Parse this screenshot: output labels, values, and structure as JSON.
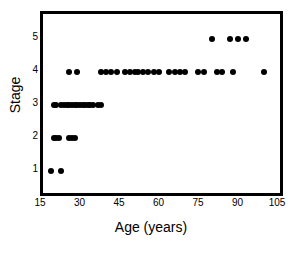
{
  "chart_data": {
    "type": "scatter",
    "title": "",
    "xlabel": "Age (years)",
    "ylabel": "Stage",
    "xlim": [
      15,
      105
    ],
    "ylim": [
      0.35,
      5.75
    ],
    "grid": false,
    "legend": "none",
    "marker": "filled-circle",
    "marker_color": "#000000",
    "xticks": [
      15,
      30,
      45,
      60,
      75,
      90,
      105
    ],
    "xtick_labels": [
      "15",
      "30",
      "45",
      "60",
      "75",
      "90",
      "105"
    ],
    "yticks": [
      1,
      2,
      3,
      4,
      5
    ],
    "ytick_labels": [
      "1",
      "2",
      "3",
      "4",
      "5"
    ],
    "points": [
      {
        "x": 18,
        "y": 1
      },
      {
        "x": 22,
        "y": 1
      },
      {
        "x": 19,
        "y": 2
      },
      {
        "x": 20,
        "y": 2
      },
      {
        "x": 21,
        "y": 2
      },
      {
        "x": 25,
        "y": 2
      },
      {
        "x": 26,
        "y": 2
      },
      {
        "x": 27,
        "y": 2
      },
      {
        "x": 19,
        "y": 3
      },
      {
        "x": 20,
        "y": 3
      },
      {
        "x": 22,
        "y": 3
      },
      {
        "x": 23,
        "y": 3
      },
      {
        "x": 24,
        "y": 3
      },
      {
        "x": 25,
        "y": 3
      },
      {
        "x": 26,
        "y": 3
      },
      {
        "x": 27,
        "y": 3
      },
      {
        "x": 28,
        "y": 3
      },
      {
        "x": 29,
        "y": 3
      },
      {
        "x": 30,
        "y": 3
      },
      {
        "x": 31,
        "y": 3
      },
      {
        "x": 32,
        "y": 3
      },
      {
        "x": 33,
        "y": 3
      },
      {
        "x": 34,
        "y": 3
      },
      {
        "x": 36,
        "y": 3
      },
      {
        "x": 37,
        "y": 3
      },
      {
        "x": 25,
        "y": 4
      },
      {
        "x": 28,
        "y": 4
      },
      {
        "x": 37,
        "y": 4
      },
      {
        "x": 39,
        "y": 4
      },
      {
        "x": 41,
        "y": 4
      },
      {
        "x": 43,
        "y": 4
      },
      {
        "x": 46,
        "y": 4
      },
      {
        "x": 48,
        "y": 4
      },
      {
        "x": 50,
        "y": 4
      },
      {
        "x": 51,
        "y": 4
      },
      {
        "x": 53,
        "y": 4
      },
      {
        "x": 55,
        "y": 4
      },
      {
        "x": 57,
        "y": 4
      },
      {
        "x": 59,
        "y": 4
      },
      {
        "x": 63,
        "y": 4
      },
      {
        "x": 65,
        "y": 4
      },
      {
        "x": 67,
        "y": 4
      },
      {
        "x": 69,
        "y": 4
      },
      {
        "x": 74,
        "y": 4
      },
      {
        "x": 76,
        "y": 4
      },
      {
        "x": 81,
        "y": 4
      },
      {
        "x": 83,
        "y": 4
      },
      {
        "x": 87,
        "y": 4
      },
      {
        "x": 99,
        "y": 4
      },
      {
        "x": 79,
        "y": 5
      },
      {
        "x": 86,
        "y": 5
      },
      {
        "x": 89,
        "y": 5
      },
      {
        "x": 92,
        "y": 5
      }
    ]
  }
}
